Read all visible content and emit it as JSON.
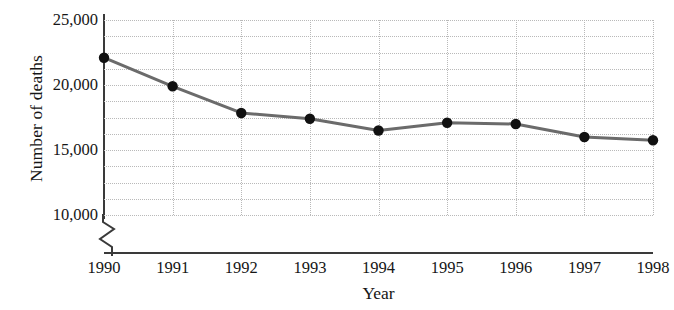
{
  "chart_data": {
    "type": "line",
    "title": "",
    "xlabel": "Year",
    "ylabel": "Number of deaths",
    "categories": [
      "1990",
      "1991",
      "1992",
      "1993",
      "1994",
      "1995",
      "1996",
      "1997",
      "1998"
    ],
    "values": [
      22100,
      19900,
      17850,
      17400,
      16500,
      17100,
      17000,
      16000,
      15750
    ],
    "series": [
      {
        "name": "Number of deaths",
        "values": [
          22100,
          19900,
          17850,
          17400,
          16500,
          17100,
          17000,
          16000,
          15750
        ]
      }
    ],
    "ylim": [
      10000,
      25000
    ],
    "y_ticks": [
      10000,
      15000,
      20000,
      25000
    ],
    "y_tick_labels": [
      "10,000",
      "15,000",
      "20,000",
      "25,000"
    ],
    "y_minor_gridlines": [
      11250,
      12500,
      13750,
      16250,
      17500,
      18750,
      21250,
      22500,
      23750
    ],
    "y_axis_broken": true,
    "y_axis_break_symbol": "zigzag",
    "grid": "dotted-both",
    "legend": "none",
    "marker": "filled-circle",
    "line_color": "#6b6b6b",
    "marker_color": "#111111",
    "grid_color": "#b9b9b9",
    "axis_color": "#3a3a3a",
    "background_color": "#ffffff"
  },
  "axes": {
    "y_title": "Number of deaths",
    "x_title": "Year"
  }
}
